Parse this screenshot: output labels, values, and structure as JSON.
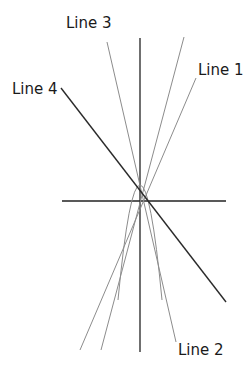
{
  "diagram": {
    "type": "coordinate-plane-lines",
    "colors": {
      "axis": "#222222",
      "light_line": "#8c8c8c",
      "dark_line": "#2a2a2a",
      "text": "#1a1a1a"
    },
    "axes": {
      "vertical": {
        "x1": 140,
        "y1": 38,
        "x2": 140,
        "y2": 352
      },
      "horizontal": {
        "x1": 62,
        "y1": 201,
        "x2": 226,
        "y2": 201
      }
    },
    "lines": [
      {
        "id": "line-1",
        "label": "Line 1",
        "x1": 196,
        "y1": 78,
        "x2": 80,
        "y2": 350,
        "style": "light"
      },
      {
        "id": "line-2-3",
        "label": "Line 3 / Line 2",
        "x1": 107,
        "y1": 42,
        "x2": 176,
        "y2": 342,
        "style": "light"
      },
      {
        "id": "line-unlabeled",
        "label": "",
        "x1": 184,
        "y1": 37,
        "x2": 101,
        "y2": 350,
        "style": "light"
      },
      {
        "id": "line-4",
        "label": "Line 4",
        "x1": 61,
        "y1": 88,
        "x2": 226,
        "y2": 302,
        "style": "dark"
      }
    ],
    "parabola": {
      "path": "M 118 300 Q 140 70 162 300",
      "style": "light"
    },
    "labels": [
      {
        "id": "label-line-3",
        "text": "Line 3",
        "x": 66,
        "y": 16
      },
      {
        "id": "label-line-1",
        "text": "Line 1",
        "x": 198,
        "y": 63
      },
      {
        "id": "label-line-4",
        "text": "Line 4",
        "x": 12,
        "y": 82
      },
      {
        "id": "label-line-2",
        "text": "Line 2",
        "x": 178,
        "y": 343
      }
    ]
  }
}
